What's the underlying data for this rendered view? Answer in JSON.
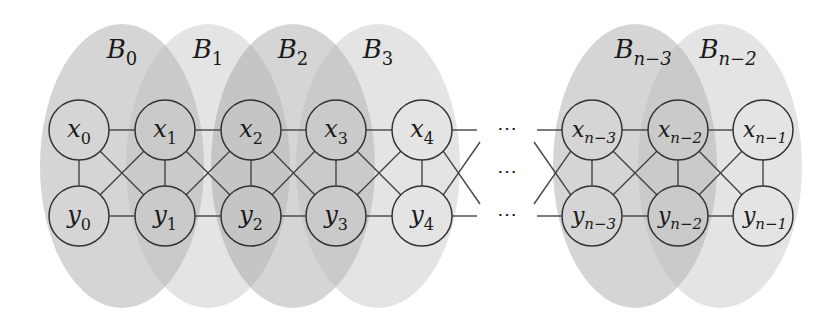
{
  "diagram": {
    "type": "graph",
    "bags": [
      {
        "id": "B0",
        "base": "B",
        "sub": "0",
        "cx": 122,
        "shade": "dark"
      },
      {
        "id": "B1",
        "base": "B",
        "sub": "1",
        "cx": 208,
        "shade": "light"
      },
      {
        "id": "B2",
        "base": "B",
        "sub": "2",
        "cx": 293,
        "shade": "dark"
      },
      {
        "id": "B3",
        "base": "B",
        "sub": "3",
        "cx": 378,
        "shade": "light"
      },
      {
        "id": "Bn-3",
        "base": "B",
        "sub": "n−3",
        "cx": 635,
        "shade": "dark"
      },
      {
        "id": "Bn-2",
        "base": "B",
        "sub": "n−2",
        "cx": 720,
        "shade": "light"
      }
    ],
    "top_nodes": [
      {
        "id": "x0",
        "base": "x",
        "sub": "0",
        "cx": 79
      },
      {
        "id": "x1",
        "base": "x",
        "sub": "1",
        "cx": 165
      },
      {
        "id": "x2",
        "base": "x",
        "sub": "2",
        "cx": 251
      },
      {
        "id": "x3",
        "base": "x",
        "sub": "3",
        "cx": 336
      },
      {
        "id": "x4",
        "base": "x",
        "sub": "4",
        "cx": 422
      },
      {
        "id": "xn-3",
        "base": "x",
        "sub": "n−3",
        "cx": 592
      },
      {
        "id": "xn-2",
        "base": "x",
        "sub": "n−2",
        "cx": 678
      },
      {
        "id": "xn-1",
        "base": "x",
        "sub": "n−1",
        "cx": 763
      }
    ],
    "bottom_nodes": [
      {
        "id": "y0",
        "base": "y",
        "sub": "0",
        "cx": 79
      },
      {
        "id": "y1",
        "base": "y",
        "sub": "1",
        "cx": 165
      },
      {
        "id": "y2",
        "base": "y",
        "sub": "2",
        "cx": 251
      },
      {
        "id": "y3",
        "base": "y",
        "sub": "3",
        "cx": 336
      },
      {
        "id": "y4",
        "base": "y",
        "sub": "4",
        "cx": 422
      },
      {
        "id": "yn-3",
        "base": "y",
        "sub": "n−3",
        "cx": 592
      },
      {
        "id": "yn-2",
        "base": "y",
        "sub": "n−2",
        "cx": 678
      },
      {
        "id": "yn-1",
        "base": "y",
        "sub": "n−1",
        "cx": 763
      }
    ],
    "ellipsis": "⋯",
    "edges": "each x_i–x_{i+1}, y_i–y_{i+1}, x_i–y_i, x_i–y_{i+1}, y_i–x_{i+1}; gap between index 4 and n−3 shown with ellipses",
    "colors": {
      "bag_dark": "#9a9a9a",
      "bag_light": "#b8b8b8",
      "stroke": "#333333"
    }
  }
}
